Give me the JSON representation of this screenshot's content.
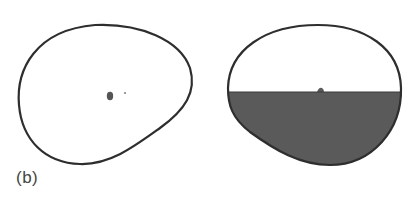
{
  "figure": {
    "panel_label": "(b)",
    "colors": {
      "outline": "#2e2e2e",
      "fill": "#5a5a5a",
      "background": "#ffffff"
    },
    "left_shape": {
      "description": "empty closed rounded outline with small central particle",
      "particles": 2
    },
    "right_shape": {
      "description": "closed rounded outline, lower half filled with dark liquid, small bump at surface"
    }
  }
}
